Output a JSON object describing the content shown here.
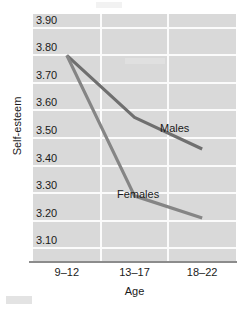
{
  "chart_data": {
    "type": "line",
    "title": "",
    "xlabel": "Age",
    "ylabel": "Self-esteem",
    "categories": [
      "9–12",
      "13–17",
      "18–22"
    ],
    "series": [
      {
        "name": "Males",
        "values": [
          3.8,
          3.575,
          3.46
        ],
        "color": "#6f6f6f"
      },
      {
        "name": "Females",
        "values": [
          3.8,
          3.29,
          3.21
        ],
        "color": "#858585"
      }
    ],
    "ylim": [
      3.05,
      3.95
    ],
    "yticks": [
      "3.90",
      "3.80",
      "3.70",
      "3.60",
      "3.50",
      "3.40",
      "3.30",
      "3.20",
      "3.10"
    ],
    "ytick_values": [
      3.9,
      3.8,
      3.7,
      3.6,
      3.5,
      3.4,
      3.3,
      3.2,
      3.1
    ],
    "grid": true,
    "legend_position": "inline",
    "plot_background": "#d9d9d9",
    "gridline_color": "#fbfbfb",
    "axis_line_color": "#8c8c8c"
  },
  "axes": {
    "y_title": "Self-esteem",
    "x_title": "Age"
  },
  "labels": {
    "males": "Males",
    "females": "Females"
  }
}
